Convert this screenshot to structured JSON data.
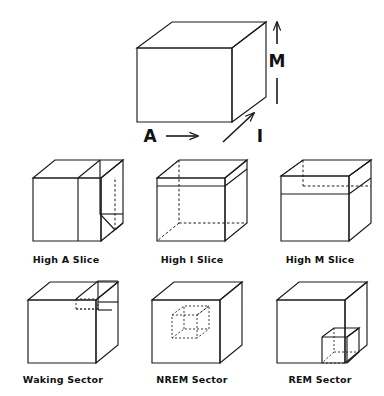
{
  "figure": {
    "background_color": "#ffffff",
    "stroke_color": "#1a1a1a",
    "axes": [
      {
        "id": "activation",
        "label": "A",
        "direction": "horizontal-right",
        "description": "Activation axis arrow pointing right beneath the master cube"
      },
      {
        "id": "modulation",
        "label": "M",
        "direction": "vertical-up",
        "description": "Modulation axis arrow pointing up at the right of the master cube"
      },
      {
        "id": "input",
        "label": "I",
        "direction": "diagonal-up-right",
        "description": "Input source axis arrow pointing up-right along the depth edge"
      }
    ],
    "master_cube": {
      "name": "reference-cube",
      "caption": ""
    },
    "panels": [
      {
        "id": "high-a-slice",
        "label": "High A Slice",
        "row": 1,
        "column": 1,
        "slice": "vertical slab on the high-A (right) side of the cube"
      },
      {
        "id": "high-i-slice",
        "label": "High I Slice",
        "row": 1,
        "column": 2,
        "slice": "slab across the front face on the high-I side of the cube"
      },
      {
        "id": "high-m-slice",
        "label": "High M Slice",
        "row": 1,
        "column": 3,
        "slice": "horizontal slab at the top (high-M) of the cube"
      },
      {
        "id": "waking-sector",
        "label": "Waking Sector",
        "row": 2,
        "column": 1,
        "sector": "small sub-cube at the upper rear-right corner"
      },
      {
        "id": "nrem-sector",
        "label": "NREM Sector",
        "row": 2,
        "column": 2,
        "sector": "small dashed sub-cube at the centre of the cube"
      },
      {
        "id": "rem-sector",
        "label": "REM Sector",
        "row": 2,
        "column": 3,
        "sector": "small sub-cube at the lower front-right corner"
      }
    ]
  }
}
